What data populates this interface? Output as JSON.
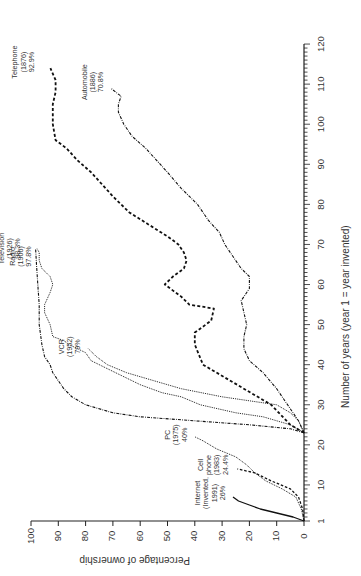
{
  "chart_data": {
    "type": "line",
    "orientation": "rotated-90-ccw",
    "title": "",
    "xlabel": "Number of years (year 1 = year invented)",
    "ylabel": "Percentage of ownership",
    "xlim": [
      1,
      120
    ],
    "ylim": [
      0,
      100
    ],
    "x_ticks": [
      "1",
      "10",
      "20",
      "30",
      "40",
      "50",
      "60",
      "70",
      "80",
      "90",
      "100",
      "110",
      "120"
    ],
    "y_ticks": [
      "0",
      "10",
      "20",
      "30",
      "40",
      "50",
      "60",
      "70",
      "80",
      "90",
      "100"
    ],
    "grid": false,
    "legend": "inline labels at series ends",
    "series": [
      {
        "name": "Telephone",
        "invented": "1876",
        "final_value_label": "92.9%",
        "style": "dashed-thick",
        "label_lines": [
          "Telephone",
          "(1876)",
          "92.9%"
        ],
        "points": [
          [
            23,
            0
          ],
          [
            25,
            5
          ],
          [
            30,
            12
          ],
          [
            36,
            27
          ],
          [
            40,
            37
          ],
          [
            45,
            40
          ],
          [
            48,
            40
          ],
          [
            51,
            34
          ],
          [
            54,
            33
          ],
          [
            55,
            42
          ],
          [
            57,
            45
          ],
          [
            60,
            51
          ],
          [
            62,
            48
          ],
          [
            64,
            44
          ],
          [
            66,
            43
          ],
          [
            68,
            44
          ],
          [
            70,
            46
          ],
          [
            72,
            50
          ],
          [
            75,
            57
          ],
          [
            78,
            64
          ],
          [
            82,
            70
          ],
          [
            85,
            74
          ],
          [
            88,
            78
          ],
          [
            91,
            83
          ],
          [
            94,
            87
          ],
          [
            96,
            91
          ],
          [
            100,
            92
          ],
          [
            105,
            92
          ],
          [
            108,
            91
          ],
          [
            111,
            91
          ],
          [
            114,
            92.9
          ]
        ]
      },
      {
        "name": "Automobile",
        "invented": "1886",
        "final_value_label": "70.8%",
        "style": "dash-dot",
        "label_lines": [
          "Automobile",
          "(1886)",
          "70.8%"
        ],
        "points": [
          [
            23,
            0
          ],
          [
            26,
            2
          ],
          [
            30,
            6
          ],
          [
            34,
            10
          ],
          [
            38,
            15
          ],
          [
            41,
            20
          ],
          [
            44,
            22
          ],
          [
            47,
            22
          ],
          [
            50,
            21
          ],
          [
            53,
            22
          ],
          [
            56,
            23
          ],
          [
            59,
            20
          ],
          [
            62,
            20
          ],
          [
            64,
            23
          ],
          [
            67,
            26
          ],
          [
            70,
            29
          ],
          [
            73,
            31
          ],
          [
            76,
            35
          ],
          [
            80,
            39
          ],
          [
            84,
            45
          ],
          [
            88,
            50
          ],
          [
            91,
            54
          ],
          [
            94,
            58
          ],
          [
            97,
            63
          ],
          [
            100,
            66
          ],
          [
            103,
            68
          ],
          [
            105,
            68
          ],
          [
            107,
            67
          ],
          [
            108,
            69
          ],
          [
            109,
            70.8
          ]
        ]
      },
      {
        "name": "Television",
        "invented": "1926",
        "final_value_label": "98.3%",
        "style": "dash-dot",
        "label_lines": [
          "Television",
          "(1926)",
          "98.3%"
        ],
        "points": [
          [
            23,
            0
          ],
          [
            24,
            5
          ],
          [
            25,
            20
          ],
          [
            26,
            40
          ],
          [
            27,
            60
          ],
          [
            28,
            70
          ],
          [
            30,
            80
          ],
          [
            32,
            85
          ],
          [
            34,
            88
          ],
          [
            36,
            90
          ],
          [
            38,
            92
          ],
          [
            40,
            93
          ],
          [
            42,
            95
          ],
          [
            45,
            96
          ],
          [
            50,
            97
          ],
          [
            55,
            97
          ],
          [
            60,
            97.5
          ],
          [
            65,
            98
          ],
          [
            69,
            98.3
          ]
        ]
      },
      {
        "name": "Radio",
        "invented": "1906",
        "final_value_label": "97.8%",
        "style": "dotted",
        "label_lines": [
          "Radio",
          "(1906)",
          "97.8%"
        ],
        "points": [
          [
            23,
            0
          ],
          [
            25,
            5
          ],
          [
            27,
            15
          ],
          [
            28,
            25
          ],
          [
            30,
            38
          ],
          [
            32,
            45
          ],
          [
            33,
            52
          ],
          [
            35,
            60
          ],
          [
            37,
            66
          ],
          [
            39,
            72
          ],
          [
            41,
            78
          ],
          [
            43,
            80
          ],
          [
            45,
            86
          ],
          [
            46,
            88
          ],
          [
            47,
            92
          ],
          [
            50,
            93
          ],
          [
            53,
            95
          ],
          [
            55,
            95
          ],
          [
            58,
            93
          ],
          [
            60,
            92
          ],
          [
            62,
            93
          ],
          [
            64,
            96
          ],
          [
            66,
            97
          ],
          [
            68,
            97
          ],
          [
            69,
            97.8
          ]
        ]
      },
      {
        "name": "VCR",
        "invented": "1952",
        "final_value_label": "79%",
        "style": "dotted",
        "label_lines": [
          "VCR",
          "(1952)",
          "79%"
        ],
        "points": [
          [
            23,
            0
          ],
          [
            26,
            2
          ],
          [
            28,
            5
          ],
          [
            30,
            10
          ],
          [
            32,
            30
          ],
          [
            34,
            45
          ],
          [
            36,
            55
          ],
          [
            38,
            65
          ],
          [
            40,
            72
          ],
          [
            42,
            76
          ],
          [
            44,
            79
          ]
        ]
      },
      {
        "name": "PC",
        "invented": "1975",
        "final_value_label": "40%",
        "style": "dotted",
        "label_lines": [
          "PC",
          "(1975)",
          "40%"
        ],
        "points": [
          [
            1,
            0
          ],
          [
            4,
            1
          ],
          [
            7,
            3
          ],
          [
            9,
            8
          ],
          [
            11,
            14
          ],
          [
            13,
            18
          ],
          [
            15,
            21
          ],
          [
            17,
            25
          ],
          [
            19,
            32
          ],
          [
            21,
            37
          ],
          [
            22,
            40
          ]
        ]
      },
      {
        "name": "Cell phone",
        "invented": "1983",
        "final_value_label": "24.4%",
        "style": "dashed",
        "label_lines": [
          "Cell",
          "phone",
          "(1983)",
          "24.4%"
        ],
        "points": [
          [
            1,
            0
          ],
          [
            4,
            0.5
          ],
          [
            7,
            2
          ],
          [
            9,
            5
          ],
          [
            11,
            12
          ],
          [
            13,
            18
          ],
          [
            14,
            24.4
          ]
        ]
      },
      {
        "name": "Internet",
        "invented": "1991",
        "final_value_label": "26%",
        "style": "solid",
        "label_lines": [
          "Internet",
          "(Invented,",
          "1991)",
          "26%"
        ],
        "points": [
          [
            1,
            0
          ],
          [
            2,
            4
          ],
          [
            3,
            10
          ],
          [
            4,
            16
          ],
          [
            5,
            20
          ],
          [
            6,
            24
          ],
          [
            7,
            26
          ]
        ]
      }
    ]
  }
}
